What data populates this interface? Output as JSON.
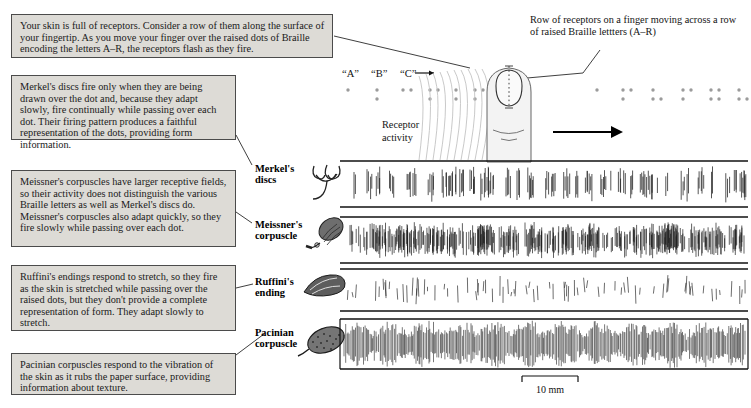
{
  "figure": {
    "units": "10 mm"
  },
  "callouts": [
    {
      "id": "intro",
      "text": "Your skin is full of receptors. Consider a row of them along the surface of your fingertip. As you move your finger over the raised dots of Braille encoding the letters A–R, the receptors flash as they fire."
    },
    {
      "id": "merkel",
      "text": "Merkel's discs fire only when they are being drawn over the dot and, because they adapt slowly, fire continually while passing over each dot. Their firing pattern produces a faithful representation of the dots, providing form information."
    },
    {
      "id": "meissner",
      "text": "Meissner's corpuscles have larger receptive fields, so their activity does not distinguish the various Braille letters as well as Merkel's discs do. Meissner's corpuscles also adapt quickly, so they fire slowly while passing over each dot."
    },
    {
      "id": "ruffini",
      "text": "Ruffini's endings respond to stretch, so they fire as the skin is stretched while passing over the raised dots, but they don't provide a complete representation of form. They adapt slowly to stretch."
    },
    {
      "id": "pacinian",
      "text": "Pacinian corpuscles respond to the vibration of the skin as it rubs the paper surface, providing information about texture."
    }
  ],
  "annotations": {
    "row_of_receptors": "Row of receptors on a finger moving across a row of raised Braille lettters (A–R)",
    "receptor_activity": "Receptor activity",
    "braille_letters": [
      "“A”",
      "“B”",
      "“C”"
    ],
    "scale_bar": "10 mm"
  },
  "receptors": [
    {
      "name_line1": "Merkel's",
      "name_line2": "discs",
      "icon": "merkel-disc-icon"
    },
    {
      "name_line1": "Meissner's",
      "name_line2": "corpuscle",
      "icon": "meissner-corpuscle-icon"
    },
    {
      "name_line1": "Ruffini's",
      "name_line2": "ending",
      "icon": "ruffini-ending-icon"
    },
    {
      "name_line1": "Pacinian",
      "name_line2": "corpuscle",
      "icon": "pacinian-corpuscle-icon"
    }
  ],
  "colors": {
    "callout_bg": "#dddbd6",
    "callout_border": "#4b4b4b",
    "ink": "#000000",
    "trace": "#1d1d1d",
    "braille_dot": "#9b9b9b"
  },
  "chart_data": {
    "type": "raster",
    "xlabel": "",
    "ylabel": "",
    "scale_bar_mm": 10,
    "series": [
      {
        "name": "Merkel's discs",
        "density": 0.16,
        "burstiness": 0.92,
        "amplitude": 0.78
      },
      {
        "name": "Meissner's corpuscle",
        "density": 0.42,
        "burstiness": 0.6,
        "amplitude": 0.7
      },
      {
        "name": "Ruffini's ending",
        "density": 0.09,
        "burstiness": 0.35,
        "amplitude": 0.55
      },
      {
        "name": "Pacinian corpuscle",
        "density": 0.95,
        "burstiness": 0.05,
        "amplitude": 0.92
      }
    ]
  }
}
